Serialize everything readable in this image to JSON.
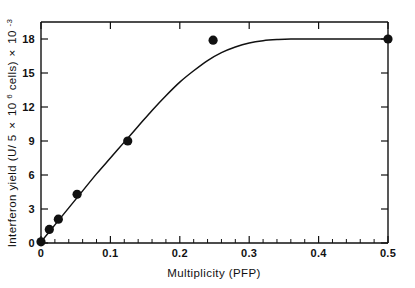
{
  "chart_data": {
    "type": "scatter",
    "title": "",
    "xlabel": "Multiplicity (PFP)",
    "ylabel": "Interferon yield  (U/ 5 × 10⁶ cells)  × 10⁻³",
    "ylabel_parts": {
      "main_1": "Interferon yield  (U/ 5",
      "times_1": "×",
      "base_1": "10",
      "exp_1": "6",
      "main_2": " cells)  ",
      "times_2": "×",
      "base_2": "10",
      "exp_2": "-3"
    },
    "xlim": [
      0,
      0.5
    ],
    "ylim": [
      0,
      19.5
    ],
    "xticks": [
      0,
      0.1,
      0.2,
      0.3,
      0.4,
      0.5
    ],
    "xtick_labels": [
      "0",
      "0.1",
      "0.2",
      "0.3",
      "0.4",
      "0.5"
    ],
    "xticks_minor_step": 0.02,
    "yticks": [
      0,
      3,
      6,
      9,
      12,
      15,
      18
    ],
    "ytick_labels": [
      "0",
      "3",
      "6",
      "9",
      "12",
      "15",
      "18"
    ],
    "grid": false,
    "legend": null,
    "series": [
      {
        "name": "Interferon yield",
        "marker": "filled-circle",
        "color": "#111111",
        "x": [
          0.0,
          0.012,
          0.025,
          0.052,
          0.125,
          0.248,
          0.5
        ],
        "y": [
          0.1,
          1.2,
          2.1,
          4.3,
          9.0,
          17.9,
          18.0
        ]
      }
    ],
    "fit_curve": {
      "name": "saturation fit",
      "color": "#111111",
      "x": [
        0.0,
        0.02,
        0.04,
        0.06,
        0.08,
        0.1,
        0.12,
        0.14,
        0.16,
        0.18,
        0.2,
        0.22,
        0.24,
        0.26,
        0.28,
        0.3,
        0.32,
        0.34,
        0.36,
        0.4,
        0.45,
        0.5
      ],
      "y": [
        0.1,
        1.6,
        3.1,
        4.6,
        6.1,
        7.5,
        8.9,
        10.3,
        11.7,
        13.0,
        14.2,
        15.2,
        16.1,
        16.8,
        17.3,
        17.65,
        17.85,
        17.95,
        18.0,
        18.0,
        18.0,
        18.0
      ]
    }
  }
}
